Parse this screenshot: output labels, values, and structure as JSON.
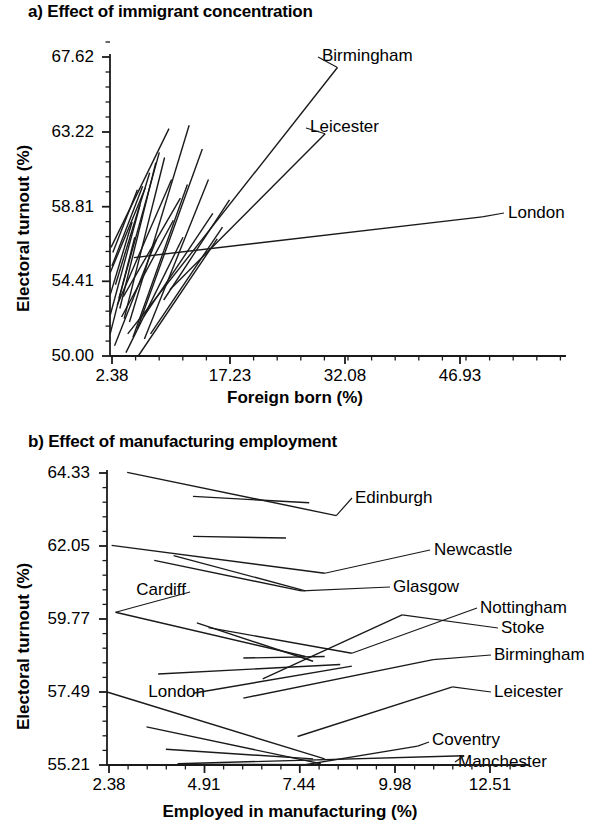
{
  "figure": {
    "panels": [
      {
        "id": "a",
        "title": "a) Effect of immigrant concentration",
        "ylabel": "Electoral turnout (%)",
        "xlabel": "Foreign born (%)",
        "yticks": [
          "67.62",
          "63.22",
          "58.81",
          "54.41",
          "50.00"
        ],
        "xticks": [
          "2.38",
          "17.23",
          "32.08",
          "46.93"
        ],
        "labels": [
          "Birmingham",
          "Leicester",
          "London"
        ]
      },
      {
        "id": "b",
        "title": "b) Effect of manufacturing employment",
        "ylabel": "Electoral turnout (%)",
        "xlabel": "Employed in manufacturing (%)",
        "yticks": [
          "64.33",
          "62.05",
          "59.77",
          "57.49",
          "55.21"
        ],
        "xticks": [
          "2.38",
          "4.91",
          "7.44",
          "9.98",
          "12.51"
        ],
        "labels": [
          "Edinburgh",
          "Newcastle",
          "Cardiff",
          "Glasgow",
          "Nottingham",
          "Stoke",
          "Birmingham",
          "London",
          "Leicester",
          "Coventry",
          "Manchester"
        ]
      }
    ]
  },
  "chart_data": [
    {
      "type": "line",
      "panel": "a",
      "title": "a) Effect of immigrant concentration",
      "xlabel": "Foreign born (%)",
      "ylabel": "Electoral turnout (%)",
      "xlim": [
        2.38,
        54.35
      ],
      "ylim": [
        50.0,
        67.62
      ],
      "xticks": [
        2.38,
        17.23,
        32.08,
        46.93
      ],
      "yticks": [
        50.0,
        54.41,
        58.81,
        63.22,
        67.62
      ],
      "minor_ticks_per_interval": 4,
      "grid": false,
      "legend": "inline-right-labels",
      "description": "Bundle of city-level regression slopes of electoral turnout on percent foreign born; most slopes are steep and positive and confined to low foreign-born values, while London is a long nearly flat slope.",
      "series": [
        {
          "name": "Birmingham",
          "x": [
            4.4,
            28.3
          ],
          "y": [
            51.3,
            67.0
          ],
          "labeled": true
        },
        {
          "name": "Leicester",
          "x": [
            9.2,
            26.9
          ],
          "y": [
            53.9,
            63.1
          ],
          "labeled": true
        },
        {
          "name": "London",
          "x": [
            5.1,
            44.8
          ],
          "y": [
            55.8,
            58.2
          ],
          "labeled": true
        },
        {
          "name": "city-01",
          "x": [
            2.5,
            9.1
          ],
          "y": [
            56.4,
            63.4
          ]
        },
        {
          "name": "city-02",
          "x": [
            3.4,
            8.0
          ],
          "y": [
            53.4,
            62.0
          ]
        },
        {
          "name": "city-03",
          "x": [
            3.5,
            7.6
          ],
          "y": [
            52.8,
            61.4
          ]
        },
        {
          "name": "city-04",
          "x": [
            4.0,
            8.6
          ],
          "y": [
            52.2,
            61.7
          ]
        },
        {
          "name": "city-05",
          "x": [
            4.6,
            11.4
          ],
          "y": [
            52.0,
            63.6
          ]
        },
        {
          "name": "city-06",
          "x": [
            5.5,
            12.9
          ],
          "y": [
            51.6,
            62.2
          ]
        },
        {
          "name": "city-07",
          "x": [
            3.0,
            6.9
          ],
          "y": [
            54.2,
            60.8
          ]
        },
        {
          "name": "city-08",
          "x": [
            3.2,
            9.4
          ],
          "y": [
            53.0,
            60.4
          ]
        },
        {
          "name": "city-09",
          "x": [
            5.0,
            11.2
          ],
          "y": [
            51.1,
            60.1
          ]
        },
        {
          "name": "city-10",
          "x": [
            6.3,
            13.6
          ],
          "y": [
            51.0,
            60.4
          ]
        },
        {
          "name": "city-11",
          "x": [
            2.6,
            6.1
          ],
          "y": [
            55.3,
            60.0
          ]
        },
        {
          "name": "city-12",
          "x": [
            2.4,
            5.8
          ],
          "y": [
            52.4,
            58.9
          ]
        },
        {
          "name": "city-13",
          "x": [
            2.4,
            5.2
          ],
          "y": [
            51.3,
            57.0
          ]
        },
        {
          "name": "city-14",
          "x": [
            2.9,
            7.7
          ],
          "y": [
            50.6,
            56.9
          ]
        },
        {
          "name": "city-15",
          "x": [
            4.2,
            10.7
          ],
          "y": [
            50.2,
            57.0
          ]
        },
        {
          "name": "city-16",
          "x": [
            5.6,
            14.6
          ],
          "y": [
            50.0,
            56.9
          ]
        },
        {
          "name": "city-17",
          "x": [
            2.4,
            4.9
          ],
          "y": [
            53.6,
            57.9
          ]
        },
        {
          "name": "city-18",
          "x": [
            3.7,
            9.6
          ],
          "y": [
            52.3,
            58.0
          ]
        },
        {
          "name": "city-19",
          "x": [
            7.0,
            15.2
          ],
          "y": [
            51.3,
            57.6
          ]
        },
        {
          "name": "city-20",
          "x": [
            2.4,
            6.4
          ],
          "y": [
            54.9,
            59.9
          ]
        },
        {
          "name": "city-21",
          "x": [
            3.9,
            10.4
          ],
          "y": [
            53.5,
            59.3
          ]
        },
        {
          "name": "city-22",
          "x": [
            6.2,
            14.1
          ],
          "y": [
            52.3,
            58.4
          ]
        },
        {
          "name": "city-23",
          "x": [
            2.7,
            5.5
          ],
          "y": [
            56.1,
            59.8
          ]
        },
        {
          "name": "city-24",
          "x": [
            8.5,
            16.0
          ],
          "y": [
            53.3,
            59.2
          ]
        }
      ]
    },
    {
      "type": "line",
      "panel": "b",
      "title": "b) Effect of manufacturing employment",
      "xlabel": "Employed in manufacturing (%)",
      "ylabel": "Electoral turnout (%)",
      "xlim": [
        2.38,
        13.3
      ],
      "ylim": [
        55.21,
        64.33
      ],
      "xticks": [
        2.38,
        4.91,
        7.44,
        9.98,
        12.51
      ],
      "yticks": [
        55.21,
        57.49,
        59.77,
        62.05,
        64.33
      ],
      "minor_ticks_per_interval": 4,
      "grid": false,
      "legend": "inline-right-labels",
      "description": "City-level regression slopes of electoral turnout on percent employed in manufacturing; most high-turnout cities slope down, while several lower-turnout cities slope up.",
      "series": [
        {
          "name": "Edinburgh",
          "x": [
            2.9,
            8.3
          ],
          "y": [
            64.35,
            63.0
          ],
          "labeled": true
        },
        {
          "name": "Newcastle",
          "x": [
            2.5,
            8.0
          ],
          "y": [
            62.07,
            61.2
          ],
          "labeled": true
        },
        {
          "name": "Cardiff",
          "x": [
            2.6,
            7.5
          ],
          "y": [
            59.98,
            58.6
          ],
          "labeled": true
        },
        {
          "name": "Glasgow",
          "x": [
            3.6,
            7.4
          ],
          "y": [
            61.6,
            60.65
          ],
          "labeled": true
        },
        {
          "name": "Nottingham",
          "x": [
            5.0,
            8.7
          ],
          "y": [
            59.5,
            58.7
          ],
          "labeled": true
        },
        {
          "name": "Stoke",
          "x": [
            6.4,
            10.0
          ],
          "y": [
            57.9,
            59.9
          ],
          "labeled": true
        },
        {
          "name": "Birmingham",
          "x": [
            5.9,
            10.8
          ],
          "y": [
            57.3,
            58.5
          ],
          "labeled": true
        },
        {
          "name": "London",
          "x": [
            2.38,
            8.0
          ],
          "y": [
            57.49,
            55.4
          ],
          "labeled": true
        },
        {
          "name": "Leicester",
          "x": [
            7.3,
            11.3
          ],
          "y": [
            56.1,
            57.65
          ],
          "labeled": true
        },
        {
          "name": "Coventry",
          "x": [
            7.5,
            10.4
          ],
          "y": [
            55.22,
            55.8
          ],
          "labeled": true
        },
        {
          "name": "Manchester",
          "x": [
            4.2,
            11.6
          ],
          "y": [
            55.25,
            55.5
          ],
          "labeled": true
        },
        {
          "name": "city-b1",
          "x": [
            4.6,
            7.6
          ],
          "y": [
            63.6,
            63.4
          ]
        },
        {
          "name": "city-b2",
          "x": [
            4.6,
            7.0
          ],
          "y": [
            62.35,
            62.3
          ]
        },
        {
          "name": "city-b3",
          "x": [
            4.1,
            7.5
          ],
          "y": [
            61.75,
            60.65
          ]
        },
        {
          "name": "city-b4",
          "x": [
            4.7,
            7.7
          ],
          "y": [
            59.65,
            58.45
          ]
        },
        {
          "name": "city-b5",
          "x": [
            5.9,
            8.0
          ],
          "y": [
            58.55,
            58.6
          ]
        },
        {
          "name": "city-b6",
          "x": [
            3.7,
            8.4
          ],
          "y": [
            58.05,
            58.35
          ]
        },
        {
          "name": "city-b7",
          "x": [
            4.6,
            8.7
          ],
          "y": [
            57.45,
            58.3
          ]
        },
        {
          "name": "city-b8",
          "x": [
            3.4,
            7.9
          ],
          "y": [
            56.4,
            55.25
          ]
        },
        {
          "name": "city-b9",
          "x": [
            3.9,
            7.7
          ],
          "y": [
            55.7,
            55.4
          ]
        },
        {
          "name": "city-b10",
          "x": [
            4.3,
            8.1
          ],
          "y": [
            55.23,
            55.22
          ]
        }
      ]
    }
  ]
}
